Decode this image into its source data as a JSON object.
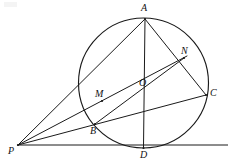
{
  "figure": {
    "background_color": "#ffffff",
    "stroke_color": "#1a1a1a",
    "width": 228,
    "height": 166,
    "circle": {
      "name": "main-circle",
      "cx": 143.5,
      "cy": 83,
      "r": 65
    },
    "points": [
      {
        "id": "A",
        "label": "A",
        "x": 145,
        "y": 19,
        "label_x": 141,
        "label_y": 3,
        "on_circle": true
      },
      {
        "id": "N",
        "label": "N",
        "x": 184,
        "y": 58,
        "label_x": 181,
        "label_y": 46,
        "on_circle": true
      },
      {
        "id": "C",
        "label": "C",
        "x": 206,
        "y": 95,
        "label_x": 210,
        "label_y": 88,
        "on_circle": true
      },
      {
        "id": "O",
        "label": "O",
        "x": 143.5,
        "y": 83,
        "label_x": 139,
        "label_y": 78,
        "on_circle": false
      },
      {
        "id": "M",
        "label": "M",
        "x": 102,
        "y": 101,
        "label_x": 95,
        "label_y": 89,
        "on_circle": true
      },
      {
        "id": "B",
        "label": "B",
        "x": 95,
        "y": 124,
        "label_x": 90,
        "label_y": 126,
        "on_circle": true
      },
      {
        "id": "D",
        "label": "D",
        "x": 143.5,
        "y": 148,
        "label_x": 140,
        "label_y": 150,
        "on_circle": true
      },
      {
        "id": "P",
        "label": "P",
        "x": 18,
        "y": 145,
        "label_x": 8,
        "label_y": 146,
        "on_circle": false
      }
    ],
    "segments": [
      {
        "id": "AD",
        "name": "segment-a-d",
        "x1": 145,
        "y1": 19,
        "x2": 143.5,
        "y2": 148
      },
      {
        "id": "AC",
        "name": "segment-a-c",
        "x1": 145,
        "y1": 19,
        "x2": 206,
        "y2": 95
      },
      {
        "id": "AP",
        "name": "segment-a-b-p",
        "x1": 145,
        "y1": 19,
        "x2": 18,
        "y2": 145
      },
      {
        "id": "PC",
        "name": "segment-p-c",
        "x1": 18,
        "y1": 145,
        "x2": 206,
        "y2": 95
      },
      {
        "id": "PN",
        "name": "segment-p-m-o-n",
        "x1": 18,
        "y1": 145,
        "x2": 187,
        "y2": 56
      },
      {
        "id": "PD",
        "name": "segment-p-d",
        "x1": 18,
        "y1": 145,
        "x2": 228,
        "y2": 145
      },
      {
        "id": "BN",
        "name": "segment-b-n",
        "x1": 95,
        "y1": 124,
        "x2": 184,
        "y2": 58
      }
    ]
  }
}
